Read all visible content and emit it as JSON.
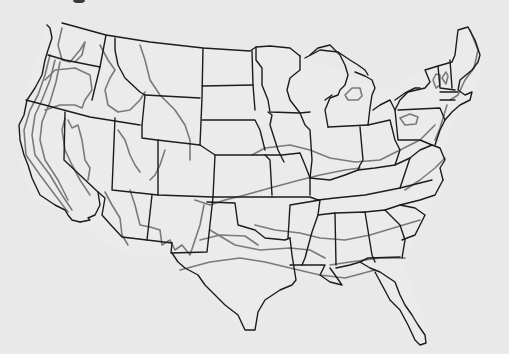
{
  "map": {
    "title": "",
    "subject": "Contiguous United States outline map",
    "colors": {
      "background": "#e9e9e9",
      "state_border": "#1c1c1c",
      "zone_line": "#7a7a7a"
    },
    "layers": [
      {
        "name": "state-borders",
        "style": "solid black"
      },
      {
        "name": "zone-contours",
        "style": "solid gray"
      }
    ],
    "labels": []
  }
}
